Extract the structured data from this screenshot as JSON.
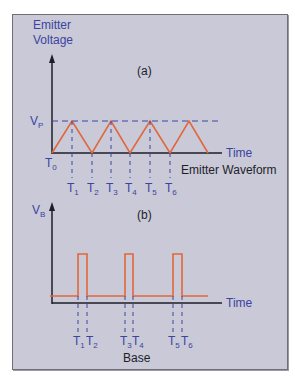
{
  "diagram": {
    "panel_a": {
      "y_label_line1": "Emitter",
      "y_label_line2": "Voltage",
      "tag": "(a)",
      "peak_label": "V",
      "peak_sub": "P",
      "origin_label": "T",
      "origin_sub": "0",
      "x_label": "Time",
      "caption": "Emitter Waveform",
      "ticks": [
        {
          "t": "T",
          "s": "1"
        },
        {
          "t": "T",
          "s": "2"
        },
        {
          "t": "T",
          "s": "3"
        },
        {
          "t": "T",
          "s": "4"
        },
        {
          "t": "T",
          "s": "5"
        },
        {
          "t": "T",
          "s": "6"
        }
      ]
    },
    "panel_b": {
      "y_label": "V",
      "y_sub": "B",
      "tag": "(b)",
      "x_label": "Time",
      "caption": "Base",
      "ticks": [
        {
          "t": "T",
          "s": "1"
        },
        {
          "t": "T",
          "s": "2"
        },
        {
          "t": "T",
          "s": "3"
        },
        {
          "t": "T",
          "s": "4"
        },
        {
          "t": "T",
          "s": "5"
        },
        {
          "t": "T",
          "s": "6"
        }
      ]
    },
    "colors": {
      "background": "#c9c9d8",
      "waveform": "#e0683a",
      "axis": "#1e1e28",
      "labels": "#3b44a0",
      "guides": "#3b44a0"
    }
  }
}
